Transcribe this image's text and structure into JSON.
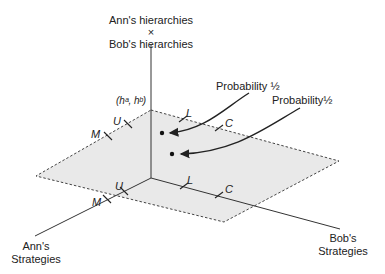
{
  "title_axis_vertical": {
    "line1": "Ann's hierarchies",
    "line2": "×",
    "line3": "Bob's hierarchies"
  },
  "axis_ann": {
    "line1": "Ann's",
    "line2": "Strategies"
  },
  "axis_bob": {
    "line1": "Bob's",
    "line2": "Strategies"
  },
  "point_label": "(hᵃ, hᵇ)",
  "ann_strategies": [
    "U",
    "M"
  ],
  "bob_strategies": [
    "L",
    "C"
  ],
  "annotations": [
    {
      "text": "Probability ½"
    },
    {
      "text": "Probability½"
    }
  ],
  "colors": {
    "plane_fill": "#e9e9e9",
    "ink": "#222222"
  }
}
